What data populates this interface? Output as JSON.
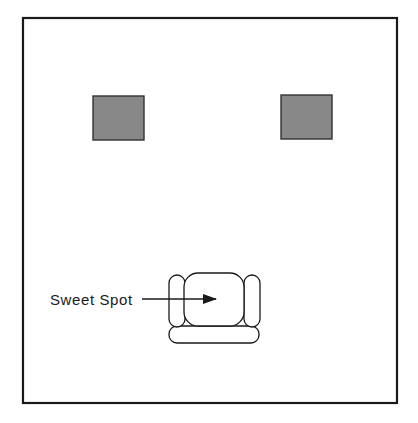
{
  "diagram": {
    "type": "listening-room-layout",
    "room": {
      "x": 23,
      "y": 18,
      "width": 374,
      "height": 385,
      "stroke": "#1a1a1a",
      "fill": "#ffffff"
    },
    "speakers": [
      {
        "name": "left-speaker",
        "x": 93,
        "y": 96,
        "width": 51,
        "height": 44,
        "fill": "#888888",
        "stroke": "#333333"
      },
      {
        "name": "right-speaker",
        "x": 281,
        "y": 95,
        "width": 51,
        "height": 44,
        "fill": "#888888",
        "stroke": "#333333"
      }
    ],
    "chair": {
      "left_arm": {
        "x": 169,
        "y": 275,
        "width": 16,
        "height": 52,
        "rx": 8
      },
      "seat": {
        "x": 184,
        "y": 273,
        "width": 60,
        "height": 53,
        "rx": 14
      },
      "right_arm": {
        "x": 244,
        "y": 275,
        "width": 16,
        "height": 52,
        "rx": 8
      },
      "base": {
        "x": 169,
        "y": 326,
        "width": 90,
        "height": 17,
        "rx": 8
      },
      "stroke": "#1a1a1a"
    },
    "label": {
      "text": "Sweet Spot",
      "x": 50,
      "y": 305
    },
    "arrow": {
      "x1": 142,
      "y1": 299,
      "x2": 216,
      "y2": 299,
      "color": "#1a1a1a"
    }
  }
}
